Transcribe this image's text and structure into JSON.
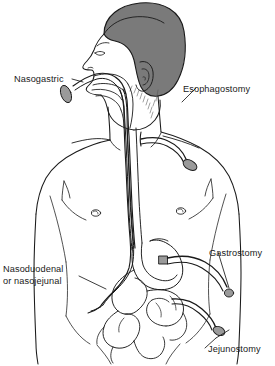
{
  "figure": {
    "background_color": "#ffffff",
    "line_color": "#1a1a1a",
    "hair_color": "#7a7a7a",
    "tube_tip_color": "#9a9a9a",
    "skin_color": "#ffffff"
  },
  "labels": {
    "nasogastric": "Nasogastric",
    "esophagostomy": "Esophagostomy",
    "nasoduodenal_line1": "Nasoduodenal",
    "nasoduodenal_line2": "or nasojejunal",
    "gastrostomy": "Gastrostomy",
    "jejunostomy": "Jejunostomy"
  },
  "anatomy": {
    "head": "head-with-hair",
    "ear": "ear",
    "nose": "nose-profile",
    "mouth": "mouth-and-tongue",
    "pharynx": "pharynx",
    "neck": "neck",
    "shoulders": "shoulders",
    "chest": "chest",
    "nipple_left": "nipple-mark-left",
    "nipple_right": "nipple-mark-right",
    "abdomen": "abdomen",
    "esophagus": "esophagus",
    "stomach": "stomach",
    "duodenum": "duodenum",
    "jejunum": "jejunum",
    "small_intestine": "small-intestine-loops"
  },
  "tubes": {
    "nasogastric": "tube entering nostril, down esophagus into stomach",
    "esophagostomy": "tube exiting surgical opening in neck",
    "nasoduodenal": "tube entering nostril, passing stomach into duodenum/jejunum",
    "gastrostomy": "tube exiting surgical port on stomach through abdominal wall",
    "jejunostomy": "tube exiting surgical port on jejunum through abdominal wall"
  }
}
